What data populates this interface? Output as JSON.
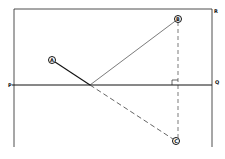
{
  "diagram": {
    "type": "reflection-ray-diagram",
    "corner_labels": {
      "P": "P",
      "Q": "Q",
      "R": "R"
    },
    "points": {
      "A": "A",
      "B": "B",
      "C": "C"
    },
    "colors": {
      "line": "#111111",
      "background": "#ffffff"
    }
  }
}
